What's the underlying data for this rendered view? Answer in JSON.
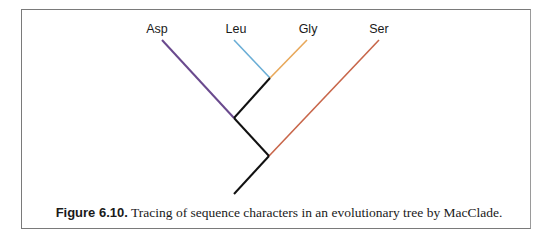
{
  "figure": {
    "leaves": [
      {
        "label": "Asp",
        "x": 155,
        "color": "#6a4a8e"
      },
      {
        "label": "Leu",
        "x": 236,
        "color": "#6aaed6"
      },
      {
        "label": "Gly",
        "x": 310,
        "color": "#e8a85a"
      },
      {
        "label": "Ser",
        "x": 379,
        "color": "#c8664a"
      }
    ],
    "internal_branch_color": "#111111",
    "caption": {
      "label": "Figure 6.10.",
      "text": " Tracing of sequence characters in an evolutionary tree by MacClade."
    }
  }
}
